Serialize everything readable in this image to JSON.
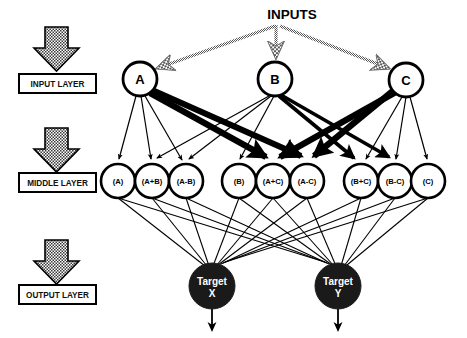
{
  "diagram": {
    "title": "INPUTS",
    "type": "neural-network-architecture",
    "canvas": {
      "width": 467,
      "height": 338,
      "background": "#ffffff"
    },
    "colors": {
      "stroke": "#000000",
      "node_fill": "#ffffff",
      "target_fill": "#1a1a1a",
      "target_text": "#ffffff",
      "arrow_dither": "#777777",
      "label_box_border": "#000000"
    },
    "layer_markers": [
      {
        "id": "input-layer",
        "label": "INPUT LAYER",
        "arrow": "down-block-arrow-dithered"
      },
      {
        "id": "middle-layer",
        "label": "MIDDLE LAYER",
        "arrow": "down-block-arrow-dithered"
      },
      {
        "id": "output-layer",
        "label": "OUTPUT LAYER",
        "arrow": "down-block-arrow-dithered"
      }
    ],
    "input_nodes": [
      {
        "id": "in-a",
        "label": "A",
        "cx": 140,
        "cy": 79,
        "r": 17
      },
      {
        "id": "in-b",
        "label": "B",
        "cx": 275,
        "cy": 79,
        "r": 17
      },
      {
        "id": "in-c",
        "label": "C",
        "cx": 406,
        "cy": 80,
        "r": 17
      }
    ],
    "middle_nodes": [
      {
        "id": "mid-a",
        "label": "(A)",
        "cx": 118,
        "cy": 181,
        "r": 17
      },
      {
        "id": "mid-apb",
        "label": "(A+B)",
        "cx": 152,
        "cy": 181,
        "r": 17
      },
      {
        "id": "mid-amb",
        "label": "(A-B)",
        "cx": 186,
        "cy": 181,
        "r": 17
      },
      {
        "id": "mid-b",
        "label": "(B)",
        "cx": 239,
        "cy": 181,
        "r": 17
      },
      {
        "id": "mid-apc",
        "label": "(A+C)",
        "cx": 273,
        "cy": 181,
        "r": 17
      },
      {
        "id": "mid-amc",
        "label": "(A-C)",
        "cx": 307,
        "cy": 181,
        "r": 17
      },
      {
        "id": "mid-bpc",
        "label": "(B+C)",
        "cx": 361,
        "cy": 181,
        "r": 17
      },
      {
        "id": "mid-bmc",
        "label": "(B-C)",
        "cx": 395,
        "cy": 181,
        "r": 17
      },
      {
        "id": "mid-c",
        "label": "(C)",
        "cx": 428,
        "cy": 181,
        "r": 17
      }
    ],
    "output_nodes": [
      {
        "id": "out-x",
        "label_line1": "Target",
        "label_line2": "X",
        "cx": 212,
        "cy": 286,
        "r": 23
      },
      {
        "id": "out-y",
        "label_line1": "Target",
        "label_line2": "Y",
        "cx": 338,
        "cy": 286,
        "r": 23
      }
    ],
    "input_feed_arrows": [
      {
        "from": "INPUTS",
        "to": "in-a",
        "style": "dithered"
      },
      {
        "from": "INPUTS",
        "to": "in-b",
        "style": "dithered"
      },
      {
        "from": "INPUTS",
        "to": "in-c",
        "style": "dithered"
      }
    ],
    "edges_input_to_middle": [
      {
        "from": "in-a",
        "to": "mid-a",
        "weight": "thin"
      },
      {
        "from": "in-a",
        "to": "mid-apb",
        "weight": "thin"
      },
      {
        "from": "in-a",
        "to": "mid-amb",
        "weight": "thin"
      },
      {
        "from": "in-a",
        "to": "mid-apc",
        "weight": "thick"
      },
      {
        "from": "in-a",
        "to": "mid-amc",
        "weight": "thick"
      },
      {
        "from": "in-b",
        "to": "mid-apb",
        "weight": "thin"
      },
      {
        "from": "in-b",
        "to": "mid-amb",
        "weight": "thin"
      },
      {
        "from": "in-b",
        "to": "mid-b",
        "weight": "thin"
      },
      {
        "from": "in-b",
        "to": "mid-bpc",
        "weight": "medium"
      },
      {
        "from": "in-b",
        "to": "mid-bmc",
        "weight": "medium"
      },
      {
        "from": "in-c",
        "to": "mid-apc",
        "weight": "thick"
      },
      {
        "from": "in-c",
        "to": "mid-amc",
        "weight": "thick"
      },
      {
        "from": "in-c",
        "to": "mid-bpc",
        "weight": "thin"
      },
      {
        "from": "in-c",
        "to": "mid-bmc",
        "weight": "thin"
      },
      {
        "from": "in-c",
        "to": "mid-c",
        "weight": "thin"
      }
    ],
    "edges_middle_to_output": {
      "pattern": "fully-connected",
      "note": "all 9 middle nodes connect to both Target X and Target Y",
      "weight": "thin"
    },
    "output_exit_arrows": [
      {
        "from": "out-x",
        "direction": "down"
      },
      {
        "from": "out-y",
        "direction": "down"
      }
    ]
  }
}
